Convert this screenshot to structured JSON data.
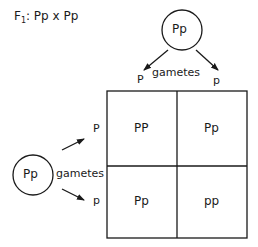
{
  "title": {
    "prefix": "F",
    "subscript": "1",
    "cross": ": Pp x  Pp"
  },
  "top_parent": {
    "genotype": "Pp",
    "gametes_label": "gametes",
    "gametes": [
      "P",
      "p"
    ]
  },
  "left_parent": {
    "genotype": "Pp",
    "gametes_label": "gametes",
    "gametes": [
      "P",
      "p"
    ]
  },
  "punnett_square": {
    "rows": [
      [
        "PP",
        "Pp"
      ],
      [
        "Pp",
        "pp"
      ]
    ]
  },
  "colors": {
    "line": "#1a1a1a",
    "background": "#ffffff"
  }
}
